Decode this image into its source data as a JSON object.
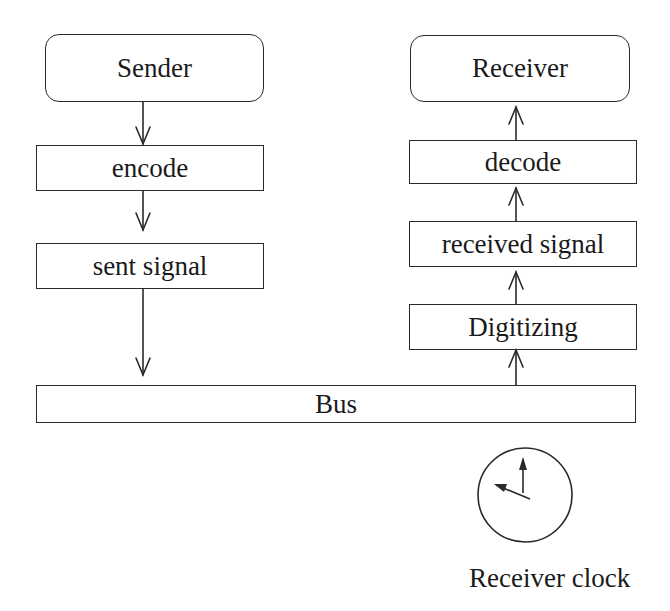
{
  "diagram": {
    "nodes": {
      "sender": "Sender",
      "encode": "encode",
      "sent_signal": "sent signal",
      "bus": "Bus",
      "digitizing": "Digitizing",
      "received_signal": "received signal",
      "decode": "decode",
      "receiver": "Receiver"
    },
    "clock_label": "Receiver clock",
    "edges": [
      {
        "from": "Sender",
        "to": "encode"
      },
      {
        "from": "encode",
        "to": "sent signal"
      },
      {
        "from": "sent signal",
        "to": "Bus"
      },
      {
        "from": "Bus",
        "to": "Digitizing"
      },
      {
        "from": "Digitizing",
        "to": "received signal"
      },
      {
        "from": "received signal",
        "to": "decode"
      },
      {
        "from": "decode",
        "to": "Receiver"
      }
    ],
    "colors": {
      "stroke": "#2a2a2a",
      "background": "#ffffff"
    }
  }
}
